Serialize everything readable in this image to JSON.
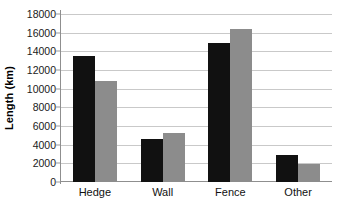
{
  "chart_data": {
    "type": "bar",
    "title": "",
    "subtitle": "",
    "xlabel": "",
    "ylabel": "Length (km)",
    "categories": [
      "Hedge",
      "Wall",
      "Fence",
      "Other"
    ],
    "series": [
      {
        "name": "Series 1",
        "color": "#111111",
        "values": [
          13500,
          4600,
          14900,
          2850
        ]
      },
      {
        "name": "Series 2",
        "color": "#8c8c8c",
        "values": [
          10800,
          5300,
          16400,
          1900
        ]
      }
    ],
    "ylim": [
      0,
      18000
    ],
    "ytick_step": 2000,
    "ytick_labels": [
      "0",
      "2000",
      "4000",
      "6000",
      "8000",
      "10000",
      "12000",
      "14000",
      "16000",
      "18000"
    ],
    "grid": true,
    "grid_axis": "y",
    "legend": false,
    "legend_position": "none",
    "annotations": [],
    "background_color": "#ffffff",
    "gridline_color": "#c9c9c9",
    "axis_color": "#8f8f8f"
  }
}
